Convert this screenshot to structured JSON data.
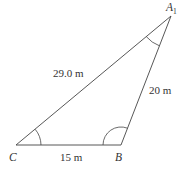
{
  "diagram": {
    "type": "triangle",
    "vertices": {
      "A": {
        "label": "A",
        "subscript": "1",
        "x": 171,
        "y": 16
      },
      "B": {
        "label": "B",
        "x": 121,
        "y": 145
      },
      "C": {
        "label": "C",
        "x": 16,
        "y": 145
      }
    },
    "sides": {
      "CA": {
        "label": "29.0 m"
      },
      "AB": {
        "label": "20 m"
      },
      "CB": {
        "label": "15 m"
      }
    },
    "angle_marks": [
      "C",
      "B",
      "A"
    ],
    "colors": {
      "line": "#444444",
      "text": "#333333",
      "background": "#ffffff"
    }
  }
}
